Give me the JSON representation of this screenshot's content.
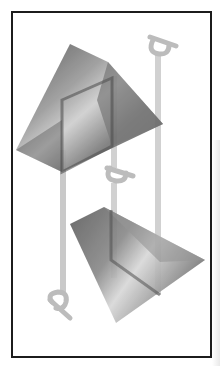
{
  "image": {
    "description": "Illustration of two translucent gray wedge-shaped prisms with vertical light-gray rods ending in rotated 'p' letterforms, inside a black rectangular frame",
    "letters": [
      "p",
      "p",
      "p"
    ],
    "colors": {
      "frame": "#1c1c1c",
      "background": "#ffffff",
      "rod": "#c8c8c8",
      "prism_dark": "#5a5a5a",
      "prism_light": "#b5b5b5"
    }
  }
}
